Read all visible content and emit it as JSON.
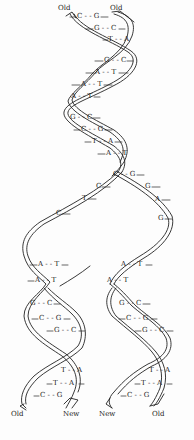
{
  "diagram": {
    "labels": {
      "top_left": "Old",
      "top_right": "Old",
      "bottom_1": "Old",
      "bottom_2": "New",
      "bottom_3": "New",
      "bottom_4": "Old"
    },
    "parent_pairs": [
      {
        "text": "C - - G",
        "x": 76,
        "y": 14
      },
      {
        "text": "G - - C",
        "x": 94,
        "y": 26
      },
      {
        "text": "T - - A",
        "x": 108,
        "y": 37
      },
      {
        "text": "G - - C",
        "x": 104,
        "y": 58
      },
      {
        "text": "A - - T",
        "x": 95,
        "y": 70
      },
      {
        "text": "A - - T",
        "x": 81,
        "y": 82
      },
      {
        "text": "A - - T",
        "x": 71,
        "y": 94
      },
      {
        "text": "G - - C",
        "x": 70,
        "y": 115
      },
      {
        "text": "C - - G",
        "x": 81,
        "y": 127
      },
      {
        "text": "T - - A",
        "x": 92,
        "y": 139
      },
      {
        "text": "A - - T",
        "x": 106,
        "y": 151
      }
    ],
    "fork_pair": {
      "text": "C - - G",
      "x": 113,
      "y": 172
    },
    "left_single": [
      {
        "text": "C",
        "x": 96,
        "y": 184
      },
      {
        "text": "T",
        "x": 82,
        "y": 196
      },
      {
        "text": "C",
        "x": 56,
        "y": 211
      }
    ],
    "right_single": [
      {
        "text": "G",
        "x": 145,
        "y": 184
      },
      {
        "text": "A",
        "x": 155,
        "y": 197
      },
      {
        "text": "G",
        "x": 158,
        "y": 216
      }
    ],
    "left_daughter_pairs": [
      {
        "text": "A - - T",
        "x": 38,
        "y": 262
      },
      {
        "text": "A - - T",
        "x": 35,
        "y": 278
      },
      {
        "text": "G - - C",
        "x": 30,
        "y": 301
      },
      {
        "text": "C - - G",
        "x": 39,
        "y": 316
      },
      {
        "text": "G - - C",
        "x": 54,
        "y": 328
      },
      {
        "text": "T - - A",
        "x": 61,
        "y": 368
      },
      {
        "text": "T - - A",
        "x": 53,
        "y": 381
      },
      {
        "text": "C - - G",
        "x": 40,
        "y": 393
      }
    ],
    "right_daughter_pairs": [
      {
        "text": "A - - T",
        "x": 121,
        "y": 262
      },
      {
        "text": "A - - T",
        "x": 107,
        "y": 278
      },
      {
        "text": "G - - C",
        "x": 119,
        "y": 301
      },
      {
        "text": "C - - G",
        "x": 126,
        "y": 316
      },
      {
        "text": "G - - C",
        "x": 142,
        "y": 328
      },
      {
        "text": "T - - A",
        "x": 149,
        "y": 368
      },
      {
        "text": "T - - A",
        "x": 141,
        "y": 381
      },
      {
        "text": "C - - G",
        "x": 127,
        "y": 393
      }
    ],
    "colors": {
      "ink": "#222222",
      "background": "#fdfdfd"
    }
  }
}
